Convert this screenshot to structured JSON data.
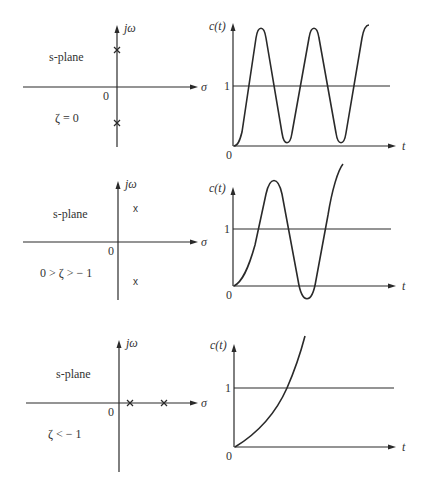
{
  "figure": {
    "rows": [
      {
        "splane": {
          "title": "s-plane",
          "x_axis_label": "σ",
          "y_axis_label": "jω",
          "origin_label": "0",
          "condition": "ζ = 0",
          "poles": "two poles on imaginary axis"
        },
        "response": {
          "y_axis_label": "c(t)",
          "x_axis_label": "t",
          "origin_label": "0",
          "ref_label": "1",
          "behavior": "undamped sustained oscillation"
        }
      },
      {
        "splane": {
          "title": "s-plane",
          "x_axis_label": "σ",
          "y_axis_label": "jω",
          "origin_label": "0",
          "condition": "0 > ζ > − 1",
          "pole_marker": "x",
          "poles": "complex conjugate poles in right half plane"
        },
        "response": {
          "y_axis_label": "c(t)",
          "x_axis_label": "t",
          "origin_label": "0",
          "ref_label": "1",
          "behavior": "growing oscillation"
        }
      },
      {
        "splane": {
          "title": "s-plane",
          "x_axis_label": "σ",
          "y_axis_label": "jω",
          "origin_label": "0",
          "condition": "ζ < − 1",
          "poles": "two real poles on positive real axis"
        },
        "response": {
          "y_axis_label": "c(t)",
          "x_axis_label": "t",
          "origin_label": "0",
          "ref_label": "1",
          "behavior": "monotonic exponential growth"
        }
      }
    ]
  }
}
